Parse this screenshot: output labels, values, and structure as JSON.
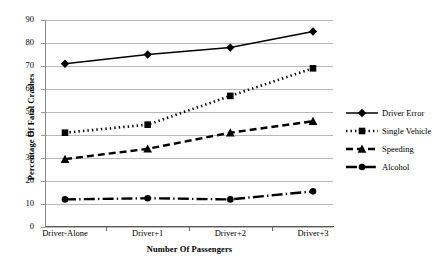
{
  "chart_data": {
    "type": "line",
    "title": "",
    "subtitle": "",
    "xlabel": "Number Of Passengers",
    "ylabel": "Percentage Of Fatal Crashes",
    "categories": [
      "Driver-Alone",
      "Driver+1",
      "Driver+2",
      "Driver+3"
    ],
    "ylim": [
      0,
      90
    ],
    "yticks": [
      0,
      10,
      20,
      30,
      40,
      50,
      60,
      70,
      80,
      90
    ],
    "grid": "horizontal",
    "legend_position": "right",
    "series": [
      {
        "name": "Driver Error",
        "values": [
          71,
          75,
          78,
          85
        ],
        "marker": "diamond",
        "line_style": "solid",
        "color": "#000000"
      },
      {
        "name": "Single Vehicle",
        "values": [
          41,
          44.5,
          57,
          69
        ],
        "marker": "square",
        "line_style": "dotted",
        "color": "#000000"
      },
      {
        "name": "Speeding",
        "values": [
          29.5,
          34,
          41,
          46
        ],
        "marker": "triangle",
        "line_style": "dashed",
        "color": "#000000"
      },
      {
        "name": "Alcohol",
        "values": [
          12,
          12.5,
          12,
          15.5
        ],
        "marker": "circle",
        "line_style": "dash-dot",
        "color": "#000000"
      }
    ]
  },
  "axis": {
    "y_tick_labels": [
      "90",
      "80",
      "70",
      "60",
      "50",
      "40",
      "30",
      "20",
      "10",
      "0"
    ],
    "y_title": "Percentage Of Fatal Crashes",
    "x_title": "Number Of Passengers",
    "x_tick_labels": [
      "Driver-Alone",
      "Driver+1",
      "Driver+2",
      "Driver+3"
    ]
  },
  "legend": {
    "items": [
      {
        "label": "Driver Error"
      },
      {
        "label": "Single Vehicle"
      },
      {
        "label": "Speeding"
      },
      {
        "label": "Alcohol"
      }
    ]
  },
  "colors": {
    "ink": "#000000",
    "gridline": "#b8b8b8",
    "axis": "#6a6a6a",
    "background": "#ffffff"
  }
}
